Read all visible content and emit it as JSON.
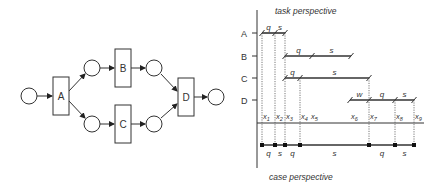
{
  "petri_net": {
    "transitions": [
      {
        "id": "A",
        "label": "A"
      },
      {
        "id": "B",
        "label": "B"
      },
      {
        "id": "C",
        "label": "C"
      },
      {
        "id": "D",
        "label": "D"
      }
    ]
  },
  "timeline": {
    "top_title": "task perspective",
    "bottom_title": "case perspective",
    "rows": [
      {
        "label": "A",
        "segments": [
          {
            "label": "q"
          },
          {
            "label": "s"
          }
        ]
      },
      {
        "label": "B",
        "segments": [
          {
            "label": "q"
          },
          {
            "label": "s"
          }
        ]
      },
      {
        "label": "C",
        "segments": [
          {
            "label": "q"
          },
          {
            "label": "s"
          }
        ]
      },
      {
        "label": "D",
        "segments": [
          {
            "label": "w"
          },
          {
            "label": "q"
          },
          {
            "label": "s"
          }
        ]
      }
    ],
    "time_points": [
      {
        "label": "x1",
        "base": "x",
        "sub": "1"
      },
      {
        "label": "x2",
        "base": "x",
        "sub": "2"
      },
      {
        "label": "x3",
        "base": "x",
        "sub": "3"
      },
      {
        "label": "x4",
        "base": "x",
        "sub": "4"
      },
      {
        "label": "x5",
        "base": "x",
        "sub": "5"
      },
      {
        "label": "x6",
        "base": "x",
        "sub": "6"
      },
      {
        "label": "x7",
        "base": "x",
        "sub": "7"
      },
      {
        "label": "x8",
        "base": "x",
        "sub": "8"
      },
      {
        "label": "x9",
        "base": "x",
        "sub": "9"
      }
    ],
    "case_segments": [
      {
        "label": "q"
      },
      {
        "label": "s"
      },
      {
        "label": "q"
      },
      {
        "label": "s"
      },
      {
        "label": "q"
      },
      {
        "label": "s"
      }
    ]
  }
}
